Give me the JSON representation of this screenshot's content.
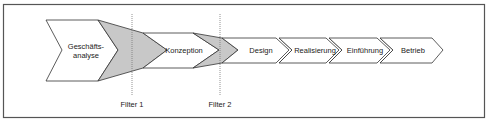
{
  "diagram": {
    "type": "process-chevron-flow",
    "colors": {
      "frame": "#555555",
      "stroke": "#333333",
      "funnel_fill": "#c8c8c8",
      "phase_fill": "#ffffff",
      "filter_line": "#777777",
      "text": "#222222"
    },
    "phases": [
      {
        "id": "geschaeftsanalyse",
        "label_line1": "Geschäfts-",
        "label_line2": "analyse"
      },
      {
        "id": "konzeption",
        "label": "Konzeption"
      },
      {
        "id": "design",
        "label": "Design"
      },
      {
        "id": "realisierung",
        "label": "Realisierung"
      },
      {
        "id": "einfuehrung",
        "label": "Einführung"
      },
      {
        "id": "betrieb",
        "label": "Betrieb"
      }
    ],
    "filters": [
      {
        "id": "filter-1",
        "label": "Filter 1"
      },
      {
        "id": "filter-2",
        "label": "Filter 2"
      }
    ]
  }
}
